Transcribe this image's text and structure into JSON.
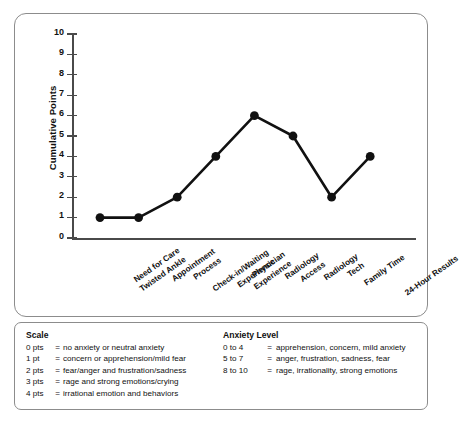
{
  "top_caption": "",
  "chart_data": {
    "type": "line",
    "title": "",
    "xlabel": "",
    "ylabel": "Cumulative Points",
    "ylim": [
      0,
      10
    ],
    "ytick_labels": [
      "10",
      "9",
      "8",
      "7",
      "6",
      "5",
      "4",
      "3",
      "2",
      "1",
      "0"
    ],
    "yticks": [
      10,
      9,
      8,
      7,
      6,
      5,
      4,
      3,
      2,
      1,
      0
    ],
    "grid": false,
    "legend_position": "none",
    "categories": [
      "Need for Care\nTwisted Ankle",
      "Appointment\nProcess",
      "Check-in/Waiting\nExperience",
      "Physician\nExperience",
      "Radiology\nAccess",
      "Radiology\nTech",
      "Family Time",
      "24-Hour Results"
    ],
    "category_lines": [
      [
        "Need for Care",
        "Twisted Ankle"
      ],
      [
        "Appointment",
        "Process"
      ],
      [
        "Check-in/Waiting",
        "Experience"
      ],
      [
        "Physician",
        "Experience"
      ],
      [
        "Radiology",
        "Access"
      ],
      [
        "Radiology",
        "Tech"
      ],
      [
        "Family Time",
        ""
      ],
      [
        "24-Hour Results",
        ""
      ]
    ],
    "values": [
      1,
      1,
      2,
      4,
      6,
      5,
      2,
      4
    ],
    "series": [
      {
        "name": "Cumulative Points",
        "values": [
          1,
          1,
          2,
          4,
          6,
          5,
          2,
          4
        ]
      }
    ],
    "line_color": "#111111",
    "marker_color": "#111111",
    "marker_shape": "circle"
  },
  "legend": {
    "scale": {
      "title": "Scale",
      "rows": [
        {
          "key": "0 pts",
          "eq": "=",
          "desc": "no anxiety or neutral anxiety"
        },
        {
          "key": "1 pt",
          "eq": "=",
          "desc": "concern or apprehension/mild fear"
        },
        {
          "key": "2 pts",
          "eq": "=",
          "desc": "fear/anger and frustration/sadness"
        },
        {
          "key": "3 pts",
          "eq": "=",
          "desc": "rage and strong emotions/crying"
        },
        {
          "key": "4 pts",
          "eq": "=",
          "desc": "irrational emotion and behaviors"
        }
      ]
    },
    "anxiety": {
      "title": "Anxiety Level",
      "rows": [
        {
          "key": "0 to 4",
          "eq": "=",
          "desc": "apprehension, concern, mild anxiety"
        },
        {
          "key": "5 to 7",
          "eq": "=",
          "desc": "anger, frustration, sadness, fear"
        },
        {
          "key": "8 to 10",
          "eq": "=",
          "desc": "rage, irrationality, strong emotions"
        }
      ]
    }
  }
}
